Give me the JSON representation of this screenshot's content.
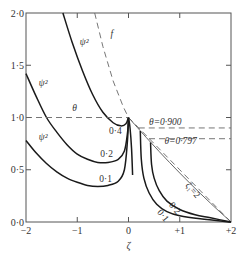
{
  "chart_data": {
    "type": "line",
    "title": "",
    "xlabel": "ζ",
    "ylabel": "",
    "xlim": [
      -2,
      2
    ],
    "ylim": [
      0,
      2
    ],
    "grid": false,
    "x_ticks": [
      {
        "value": -2,
        "label": "−2"
      },
      {
        "value": -1,
        "label": "−1"
      },
      {
        "value": 0,
        "label": "0"
      },
      {
        "value": 1,
        "label": "+1"
      },
      {
        "value": 2,
        "label": "+2"
      }
    ],
    "y_ticks": [
      {
        "value": 0,
        "label": "0·0"
      },
      {
        "value": 0.5,
        "label": "0·5"
      },
      {
        "value": 1.0,
        "label": "1·0"
      },
      {
        "value": 1.5,
        "label": "1·5"
      },
      {
        "value": 2.0,
        "label": "2·0"
      }
    ],
    "series": [
      {
        "name": "ψ² (0·4)",
        "style": "solid-thick",
        "points": [
          [
            -1.28,
            2.0
          ],
          [
            -1.1,
            1.72
          ],
          [
            -0.9,
            1.45
          ],
          [
            -0.7,
            1.22
          ],
          [
            -0.5,
            1.05
          ],
          [
            -0.3,
            0.95
          ],
          [
            -0.15,
            0.92
          ],
          [
            -0.05,
            0.94
          ],
          [
            0,
            1.0
          ]
        ]
      },
      {
        "name": "ψ² (0·2)",
        "style": "solid-thick",
        "points": [
          [
            -2.0,
            1.42
          ],
          [
            -1.8,
            1.2
          ],
          [
            -1.6,
            1.0
          ],
          [
            -1.4,
            0.86
          ],
          [
            -1.2,
            0.74
          ],
          [
            -1.0,
            0.65
          ],
          [
            -0.8,
            0.6
          ],
          [
            -0.6,
            0.57
          ],
          [
            -0.4,
            0.57
          ],
          [
            -0.2,
            0.6
          ],
          [
            -0.08,
            0.68
          ],
          [
            -0.02,
            0.85
          ],
          [
            0,
            1.0
          ]
        ]
      },
      {
        "name": "ψ² (0·1)",
        "style": "solid-thick",
        "points": [
          [
            -2.0,
            0.78
          ],
          [
            -1.8,
            0.66
          ],
          [
            -1.6,
            0.56
          ],
          [
            -1.4,
            0.48
          ],
          [
            -1.2,
            0.42
          ],
          [
            -1.0,
            0.38
          ],
          [
            -0.8,
            0.35
          ],
          [
            -0.6,
            0.34
          ],
          [
            -0.4,
            0.35
          ],
          [
            -0.2,
            0.39
          ],
          [
            -0.08,
            0.5
          ],
          [
            -0.02,
            0.78
          ],
          [
            0,
            1.0
          ]
        ]
      },
      {
        "name": "f",
        "style": "dashed",
        "points": [
          [
            -0.66,
            2.0
          ],
          [
            -0.5,
            1.68
          ],
          [
            -0.3,
            1.35
          ],
          [
            -0.1,
            1.1
          ],
          [
            0,
            1.0
          ],
          [
            1.0,
            0.5
          ],
          [
            2.0,
            0.0
          ]
        ]
      },
      {
        "name": "θ",
        "style": "dashed",
        "points": [
          [
            -2.0,
            1.0
          ],
          [
            0,
            1.0
          ]
        ]
      },
      {
        "name": "θ=0·900",
        "style": "dashed",
        "points": [
          [
            0.2,
            0.9
          ],
          [
            2.0,
            0.9
          ]
        ]
      },
      {
        "name": "θ=0·797",
        "style": "dashed",
        "points": [
          [
            0.4,
            0.797
          ],
          [
            2.0,
            0.797
          ]
        ]
      },
      {
        "name": "ζ₁=2",
        "style": "solid-thin",
        "points": [
          [
            0,
            1.0
          ],
          [
            0.4,
            0.78
          ],
          [
            0.8,
            0.57
          ],
          [
            1.2,
            0.37
          ],
          [
            1.6,
            0.18
          ],
          [
            2.0,
            0.0
          ]
        ]
      },
      {
        "name": "right 0·2",
        "style": "solid-thick",
        "points": [
          [
            0.43,
            0.76
          ],
          [
            0.45,
            0.55
          ],
          [
            0.5,
            0.42
          ],
          [
            0.6,
            0.3
          ],
          [
            0.75,
            0.2
          ],
          [
            1.0,
            0.12
          ],
          [
            1.3,
            0.07
          ],
          [
            1.6,
            0.04
          ],
          [
            2.0,
            0.0
          ]
        ]
      },
      {
        "name": "right 0·1",
        "style": "solid-thick",
        "points": [
          [
            0.23,
            0.87
          ],
          [
            0.25,
            0.6
          ],
          [
            0.3,
            0.42
          ],
          [
            0.4,
            0.28
          ],
          [
            0.55,
            0.17
          ],
          [
            0.75,
            0.1
          ],
          [
            1.0,
            0.06
          ],
          [
            1.4,
            0.03
          ],
          [
            2.0,
            0.0
          ]
        ]
      },
      {
        "name": "peak spike",
        "style": "solid-thick",
        "points": [
          [
            0,
            1.0
          ],
          [
            0.03,
            0.9
          ],
          [
            0.06,
            0.7
          ],
          [
            0.08,
            0.45
          ]
        ]
      }
    ],
    "annotations": [
      {
        "text": "f",
        "x": -0.35,
        "y": 1.77,
        "italic": true
      },
      {
        "text": "ψ²",
        "x": -0.95,
        "y": 1.69,
        "italic": true
      },
      {
        "text": "ψ²",
        "x": -1.75,
        "y": 1.3,
        "italic": true
      },
      {
        "text": "θ",
        "x": -1.1,
        "y": 1.06,
        "italic": true
      },
      {
        "text": "ψ²",
        "x": -1.75,
        "y": 0.78,
        "italic": true
      },
      {
        "text": "0·4",
        "x": -0.38,
        "y": 0.84,
        "italic": false
      },
      {
        "text": "0·2",
        "x": -0.55,
        "y": 0.62,
        "italic": false
      },
      {
        "text": "0·1",
        "x": -0.57,
        "y": 0.38,
        "italic": false
      },
      {
        "text": "θ=0·900",
        "x": 0.4,
        "y": 0.93,
        "italic": true
      },
      {
        "text": "θ=0·797",
        "x": 0.7,
        "y": 0.75,
        "italic": true
      }
    ],
    "rotated_annotations": [
      {
        "text": "ζ₁=2",
        "x": 1.1,
        "y": 0.35,
        "angle": 50
      },
      {
        "text": "0·2",
        "x": 0.78,
        "y": 0.16,
        "angle": 50
      },
      {
        "text": "0·1",
        "x": 0.55,
        "y": 0.09,
        "angle": 50
      }
    ]
  }
}
